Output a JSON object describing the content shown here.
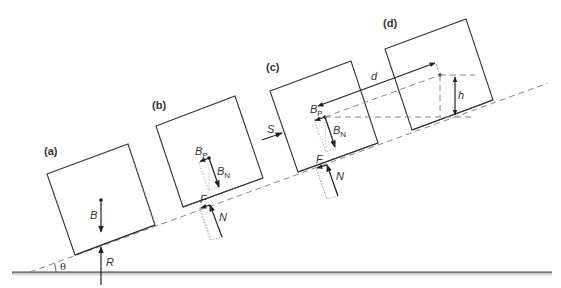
{
  "figure": {
    "angle_symbol": "θ",
    "ground_force_label": "R",
    "panels": [
      {
        "id": "a",
        "label": "(a)",
        "forces": [
          "B"
        ]
      },
      {
        "id": "b",
        "label": "(b)",
        "forces": [
          "B",
          "P",
          "N",
          "F",
          "N"
        ]
      },
      {
        "id": "c",
        "label": "(c)",
        "forces": [
          "S",
          "B",
          "P",
          "N",
          "F",
          "N"
        ]
      },
      {
        "id": "d",
        "label": "(d)",
        "dimensions": [
          "d",
          "h"
        ]
      }
    ],
    "labels": {
      "a_label": "(a)",
      "b_label": "(b)",
      "c_label": "(c)",
      "d_label": "(d)",
      "theta": "θ",
      "R": "R",
      "B": "B",
      "B_main": "B",
      "P_sub": "P",
      "N_sub": "N",
      "F": "F",
      "N": "N",
      "S": "S",
      "d": "d",
      "h": "h"
    }
  }
}
